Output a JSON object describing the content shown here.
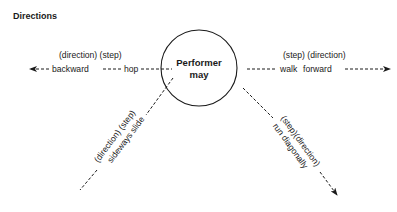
{
  "title": "Directions",
  "center": {
    "line1": "Performer",
    "line2": "may"
  },
  "branches": {
    "left": {
      "header": "(direction) (step)",
      "direction": "backward",
      "step": "hop",
      "arrow": true
    },
    "right": {
      "header": "(step) (direction)",
      "step": "walk",
      "direction": "forward",
      "arrow": true
    },
    "lower_left": {
      "header": "(direction) (step)",
      "text": "sideways slide",
      "arrow": false
    },
    "lower_right": {
      "header": "(step)(direction)",
      "text": "run diagonally",
      "arrow": true
    }
  },
  "colors": {
    "ink": "#1a1a1a",
    "background": "#ffffff"
  }
}
